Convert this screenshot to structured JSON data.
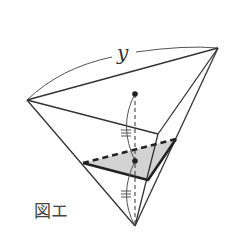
{
  "figure": {
    "caption": "図エ",
    "length_label": "y",
    "colors": {
      "line": "#333333",
      "shaded_triangle": "#d3d3d3",
      "background": "#ffffff"
    },
    "vertices": {
      "top_left": [
        27,
        100
      ],
      "top_right": [
        218,
        48
      ],
      "front_mid": [
        158,
        134
      ],
      "bottom_apex": [
        135,
        226
      ]
    },
    "points": {
      "top_dot": [
        135,
        94
      ],
      "inner_dot": [
        135,
        161
      ]
    },
    "cross_section_triangle": {
      "left": [
        83,
        163
      ],
      "back_right": [
        176,
        139
      ],
      "front": [
        148,
        180
      ]
    },
    "equal_marks": [
      "upper-segment-double-tick",
      "lower-segment-double-tick"
    ]
  }
}
